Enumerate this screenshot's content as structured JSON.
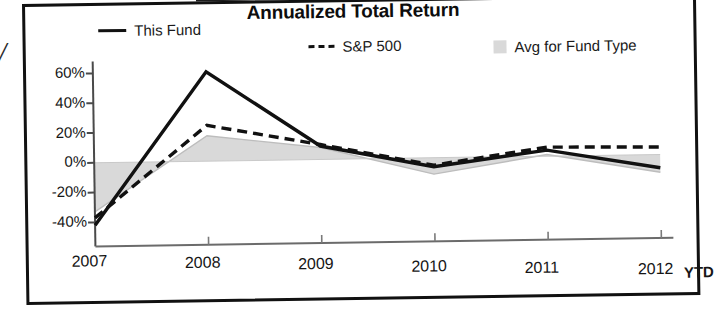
{
  "panel": {
    "margin_glyph": "/"
  },
  "chart_data": {
    "type": "line",
    "title": "Annualized Total Return",
    "xlabel": "",
    "ylabel": "",
    "categories": [
      "2007",
      "2008",
      "2009",
      "2010",
      "2011",
      "2012"
    ],
    "last_category_note": "YTD",
    "ylim": [
      -50,
      70
    ],
    "yticks": [
      60,
      40,
      20,
      0,
      -20,
      -40
    ],
    "ytick_labels": [
      "60%",
      "40%",
      "20%",
      "0%",
      "-20%",
      "-40%"
    ],
    "grid": false,
    "legend_position": "top",
    "zero_line": 0,
    "series": [
      {
        "name": "This Fund",
        "style": "solid",
        "color": "#111111",
        "values": [
          -42,
          60,
          9,
          -6,
          4,
          -9
        ]
      },
      {
        "name": "S&P 500",
        "style": "dashed",
        "color": "#111111",
        "values": [
          -37,
          24,
          10,
          -5,
          6,
          5
        ]
      },
      {
        "name": "Avg for Fund Type",
        "style": "filled-area",
        "color": "#d9d9d9",
        "values": [
          -33,
          17,
          8,
          -11,
          1,
          -12
        ]
      }
    ]
  },
  "legend": {
    "items": [
      {
        "label": "This Fund",
        "swatch": "solid-line-swatch"
      },
      {
        "label": "S&P 500",
        "swatch": "dashed-line-swatch"
      },
      {
        "label": "Avg for Fund Type",
        "swatch": "area-swatch"
      }
    ]
  }
}
